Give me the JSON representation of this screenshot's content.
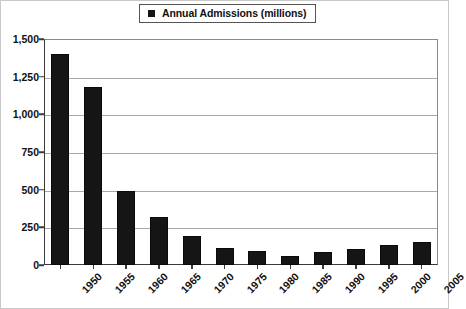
{
  "chart_data": {
    "type": "bar",
    "title": "",
    "subtitle": "",
    "xlabel": "",
    "ylabel": "",
    "legend": {
      "position": "top-center",
      "entries": [
        {
          "label": "Annual Admissions (millions)",
          "color": "#151515",
          "marker": "square"
        }
      ]
    },
    "categories": [
      "1950",
      "1955",
      "1960",
      "1965",
      "1970",
      "1975",
      "1980",
      "1985",
      "1990",
      "1995",
      "2000",
      "2005"
    ],
    "values": [
      1400,
      1180,
      490,
      320,
      190,
      110,
      90,
      60,
      85,
      105,
      130,
      150
    ],
    "series": [
      {
        "name": "Annual Admissions (millions)",
        "values": [
          1400,
          1180,
          490,
          320,
          190,
          110,
          90,
          60,
          85,
          105,
          130,
          150
        ]
      }
    ],
    "ylim": [
      0,
      1500
    ],
    "ytick_values": [
      0,
      250,
      500,
      750,
      1000,
      1250,
      1500
    ],
    "ytick_labels": [
      "0",
      "250",
      "500",
      "750",
      "1,000",
      "1,250",
      "1,500"
    ],
    "grid": "horizontal",
    "xtick_rotation": -45,
    "colors": {
      "bar": "#151515",
      "gridline": "#a8a8a8",
      "axis": "#3a3a3a",
      "frame": "#8a8a8a",
      "text": "#111111",
      "background": "#ffffff",
      "border": "#c9c9c9"
    }
  }
}
